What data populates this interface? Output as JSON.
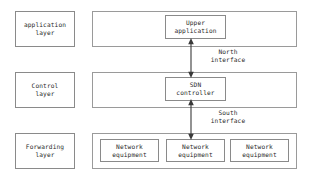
{
  "diagram": {
    "background_color": "#ffffff",
    "line_color": "#3a3a3a",
    "border_color": "#8a8a8a",
    "text_color": "#2b2b2b"
  },
  "layers": [
    {
      "id": "application",
      "label": "application\nlayer",
      "nodes": [
        {
          "id": "upper-application",
          "label": "Upper\napplication"
        }
      ]
    },
    {
      "id": "control",
      "label": "Control\nlayer",
      "nodes": [
        {
          "id": "sdn-controller",
          "label": "SDN\ncontroller"
        }
      ]
    },
    {
      "id": "forwarding",
      "label": "Forwarding\nlayer",
      "nodes": [
        {
          "id": "network-equipment-1",
          "label": "Network\nequipment"
        },
        {
          "id": "network-equipment-2",
          "label": "Network\nequipment"
        },
        {
          "id": "network-equipment-3",
          "label": "Network\nequipment"
        }
      ]
    }
  ],
  "interfaces": [
    {
      "id": "north-interface",
      "label": "North\ninterface",
      "from": "upper-application",
      "to": "sdn-controller",
      "arrow": "double"
    },
    {
      "id": "south-interface",
      "label": "South\ninterface",
      "from": "sdn-controller",
      "to": "network-equipment-2",
      "arrow": "double"
    }
  ]
}
